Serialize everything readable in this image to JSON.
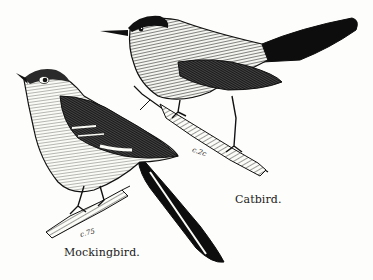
{
  "illustration": {
    "style": "black-and-white wood engraving",
    "background_color": "#fdfdfb",
    "ink_color": "#111111",
    "birds": [
      {
        "name": "catbird",
        "caption": "Catbird.",
        "signature": "c.2c",
        "position": "upper right, perched on diagonal branch"
      },
      {
        "name": "mockingbird",
        "caption": "Mockingbird.",
        "signature": "c.75",
        "position": "lower left, perched on short stub branch"
      }
    ]
  }
}
